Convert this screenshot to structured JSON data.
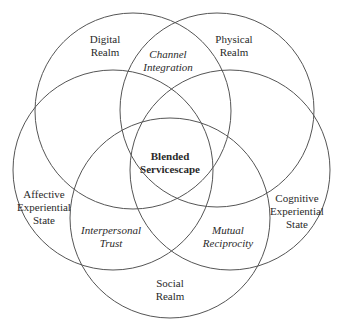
{
  "diagram": {
    "type": "venn",
    "stroke_color": "#555555",
    "circles": [
      {
        "id": "digital",
        "label_lines": [
          "Digital",
          "Realm"
        ]
      },
      {
        "id": "physical",
        "label_lines": [
          "Physical",
          "Realm"
        ]
      },
      {
        "id": "affective",
        "label_lines": [
          "Affective",
          "Experiential",
          "State"
        ]
      },
      {
        "id": "cognitive",
        "label_lines": [
          "Cognitive",
          "Experiential",
          "State"
        ]
      },
      {
        "id": "social",
        "label_lines": [
          "Social",
          "Realm"
        ]
      }
    ],
    "intersections": [
      {
        "id": "channel",
        "label_lines": [
          "Channel",
          "Integration"
        ]
      },
      {
        "id": "trust",
        "label_lines": [
          "Interpersonal",
          "Trust"
        ]
      },
      {
        "id": "reciprocity",
        "label_lines": [
          "Mutual",
          "Reciprocity"
        ]
      }
    ],
    "center": {
      "label_lines": [
        "Blended",
        "Servicescape"
      ]
    }
  }
}
